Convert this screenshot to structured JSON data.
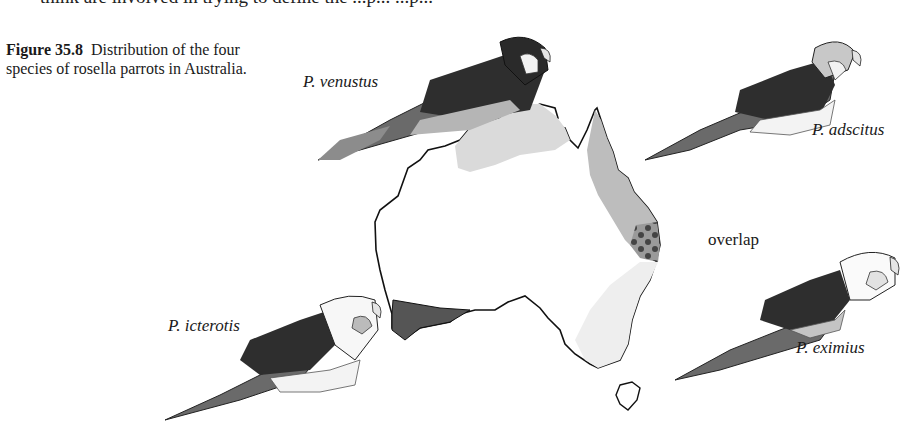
{
  "page": {
    "top_text_fragment": "think are involved in trying to define the ...p... ...p...",
    "figure": {
      "number": "Figure 35.8",
      "caption": "Distribution of the four species of rosella parrots in Australia."
    }
  },
  "species_labels": {
    "venustus": "P. venustus",
    "adscitus": "P. adscitus",
    "icterotis": "P. icterotis",
    "eximius": "P. eximius"
  },
  "map": {
    "overlap_label": "overlap",
    "regions": [
      {
        "species": "P. venustus",
        "area": "northern Australia (Kimberley / Top End)",
        "shade": "#d9d9d9"
      },
      {
        "species": "P. adscitus",
        "area": "north-east Queensland coast (Cape York to SE QLD)",
        "shade": "#bdbdbd"
      },
      {
        "species": "P. icterotis",
        "area": "south-western Western Australia",
        "shade": "#555555"
      },
      {
        "species": "P. eximius",
        "area": "south-eastern Australia and Tasmania",
        "shade": "#eeeeee"
      },
      {
        "species": "P. adscitus / P. eximius",
        "area": "overlap zone, south-east Queensland",
        "shade": "#7a7a7a"
      }
    ]
  },
  "colors": {
    "outline": "#111111",
    "dark": "#3a3a3a",
    "mid": "#7d7d7d",
    "light": "#c4c4c4",
    "paper": "#ffffff"
  }
}
